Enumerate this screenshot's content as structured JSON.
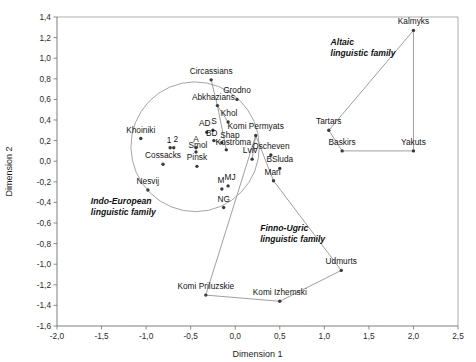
{
  "chart_data": {
    "type": "scatter",
    "title": "",
    "xlabel": "Dimension 1",
    "ylabel": "Dimension 2",
    "xlim": [
      -2.0,
      2.5
    ],
    "ylim": [
      -1.6,
      1.4
    ],
    "xticks": [
      "-2,0",
      "-1,5",
      "-1,0",
      "-0,5",
      "0,0",
      "0,5",
      "1,0",
      "1,5",
      "2,0",
      "2,5"
    ],
    "xtick_values": [
      -2.0,
      -1.5,
      -1.0,
      -0.5,
      0.0,
      0.5,
      1.0,
      1.5,
      2.0,
      2.5
    ],
    "yticks": [
      "1,4",
      "1,2",
      "1,0",
      "0,8",
      "0,6",
      "0,4",
      "0,2",
      "0,0",
      "-0,2",
      "-0,4",
      "-0,6",
      "-0,8",
      "-1,0",
      "-1,2",
      "-1,4",
      "-1,6"
    ],
    "ytick_values": [
      1.4,
      1.2,
      1.0,
      0.8,
      0.6,
      0.4,
      0.2,
      0.0,
      -0.2,
      -0.4,
      -0.6,
      -0.8,
      -1.0,
      -1.2,
      -1.4,
      -1.6
    ],
    "grid": false,
    "legend": "none",
    "decimal_separator": "comma",
    "point_color": "#3a3a3a",
    "line_color": "#8e8e8e",
    "points": [
      {
        "label": "Circassians",
        "x": -0.27,
        "y": 0.79,
        "label_dx": 0,
        "label_dy": -6
      },
      {
        "label": "Abkhazians",
        "x": -0.2,
        "y": 0.54,
        "label_dx": -4,
        "label_dy": -6
      },
      {
        "label": "Grodno",
        "x": 0.02,
        "y": 0.6,
        "label_dx": 0,
        "label_dy": -6
      },
      {
        "label": "Khol",
        "x": -0.08,
        "y": 0.38,
        "label_dx": 1,
        "label_dy": -6
      },
      {
        "label": "AD",
        "x": -0.32,
        "y": 0.28,
        "label_dx": -2,
        "label_dy": -6
      },
      {
        "label": "S",
        "x": -0.25,
        "y": 0.3,
        "label_dx": 1,
        "label_dy": -6
      },
      {
        "label": "BD",
        "x": -0.24,
        "y": 0.2,
        "label_dx": -2,
        "label_dy": -5
      },
      {
        "label": "Shap",
        "x": -0.15,
        "y": 0.18,
        "label_dx": 8,
        "label_dy": -5
      },
      {
        "label": "Kostroma",
        "x": -0.1,
        "y": 0.11,
        "label_dx": 7,
        "label_dy": -5
      },
      {
        "label": "Khoiniki",
        "x": -1.06,
        "y": 0.22,
        "label_dx": 0,
        "label_dy": -6
      },
      {
        "label": "1",
        "x": -0.73,
        "y": 0.13,
        "label_dx": -1,
        "label_dy": -5
      },
      {
        "label": "2",
        "x": -0.69,
        "y": 0.13,
        "label_dx": 2,
        "label_dy": -6
      },
      {
        "label": "A",
        "x": -0.44,
        "y": 0.13,
        "label_dx": 0,
        "label_dy": -6
      },
      {
        "label": "Smol",
        "x": -0.44,
        "y": 0.09,
        "label_dx": 2,
        "label_dy": -4
      },
      {
        "label": "Cossacks",
        "x": -0.81,
        "y": -0.03,
        "label_dx": 0,
        "label_dy": -6
      },
      {
        "label": "Pinsk",
        "x": -0.43,
        "y": -0.05,
        "label_dx": 0,
        "label_dy": -6
      },
      {
        "label": "Komi Permyats",
        "x": 0.23,
        "y": 0.25,
        "label_dx": 0,
        "label_dy": -6
      },
      {
        "label": "Lviv",
        "x": 0.19,
        "y": 0.02,
        "label_dx": -2,
        "label_dy": -6
      },
      {
        "label": "Oscheven",
        "x": 0.4,
        "y": 0.06,
        "label_dx": 0,
        "label_dy": -6
      },
      {
        "label": "BSluda",
        "x": 0.5,
        "y": -0.07,
        "label_dx": 0,
        "label_dy": -6
      },
      {
        "label": "Mari",
        "x": 0.43,
        "y": -0.19,
        "label_dx": -1,
        "label_dy": -6
      },
      {
        "label": "Nesvij",
        "x": -0.98,
        "y": -0.28,
        "label_dx": 0,
        "label_dy": -6
      },
      {
        "label": "M",
        "x": -0.15,
        "y": -0.27,
        "label_dx": -1,
        "label_dy": -6
      },
      {
        "label": "MJ",
        "x": -0.08,
        "y": -0.24,
        "label_dx": 2,
        "label_dy": -6
      },
      {
        "label": "NG",
        "x": -0.13,
        "y": -0.45,
        "label_dx": 0,
        "label_dy": -6
      },
      {
        "label": "Tartars",
        "x": 1.05,
        "y": 0.3,
        "label_dx": 0,
        "label_dy": -6
      },
      {
        "label": "Kalmyks",
        "x": 2.0,
        "y": 1.27,
        "label_dx": 0,
        "label_dy": -6
      },
      {
        "label": "Baskirs",
        "x": 1.2,
        "y": 0.1,
        "label_dx": 0,
        "label_dy": -6
      },
      {
        "label": "Yakuts",
        "x": 2.0,
        "y": 0.1,
        "label_dx": 0,
        "label_dy": -6
      },
      {
        "label": "Udmurts",
        "x": 1.19,
        "y": -1.06,
        "label_dx": 0,
        "label_dy": -6
      },
      {
        "label": "Komi Priluzskie",
        "x": -0.33,
        "y": -1.3,
        "label_dx": 0,
        "label_dy": -6
      },
      {
        "label": "Komi Izhemski",
        "x": 0.5,
        "y": -1.36,
        "label_dx": 0,
        "label_dy": -6
      }
    ],
    "groups": [
      {
        "name": "Altaic linguistic family",
        "label_lines": [
          "Altaic",
          "linguistic family"
        ],
        "label_x": 1.07,
        "label_y": 1.13,
        "shape": "polyline",
        "vertices": [
          {
            "x": 1.05,
            "y": 0.3
          },
          {
            "x": 2.0,
            "y": 1.27
          },
          {
            "x": 2.0,
            "y": 0.1
          },
          {
            "x": 1.2,
            "y": 0.1
          },
          {
            "x": 1.05,
            "y": 0.3
          }
        ]
      },
      {
        "name": "Finno-Ugric linguistic family",
        "label_lines": [
          "Finno-Ugric",
          "linguistic family"
        ],
        "label_x": 0.28,
        "label_y": -0.68,
        "shape": "polyline",
        "vertices": [
          {
            "x": 0.23,
            "y": 0.25
          },
          {
            "x": 0.43,
            "y": -0.19
          },
          {
            "x": 1.19,
            "y": -1.06
          },
          {
            "x": 0.5,
            "y": -1.36
          },
          {
            "x": -0.33,
            "y": -1.3
          },
          {
            "x": 0.23,
            "y": 0.25
          }
        ]
      },
      {
        "name": "Indo-European linguistic family",
        "label_lines": [
          "Indo-European",
          "linguistic family"
        ],
        "label_x": -1.62,
        "label_y": -0.42,
        "shape": "ellipse",
        "cx": -0.45,
        "cy": 0.14,
        "rx": 0.72,
        "ry": 0.63,
        "rotation": -12
      }
    ],
    "extra_lines": [
      {
        "name": "circassians-abkhazians-kostroma-link",
        "vertices": [
          {
            "x": -0.27,
            "y": 0.79
          },
          {
            "x": -0.2,
            "y": 0.54
          },
          {
            "x": -0.1,
            "y": 0.11
          }
        ]
      },
      {
        "name": "abkhazians-khol-link",
        "vertices": [
          {
            "x": -0.2,
            "y": 0.54
          },
          {
            "x": -0.08,
            "y": 0.38
          }
        ]
      },
      {
        "name": "bd-shap-link",
        "vertices": [
          {
            "x": -0.24,
            "y": 0.2
          },
          {
            "x": -0.15,
            "y": 0.18
          }
        ]
      },
      {
        "name": "komi-permyats-lviv-link",
        "vertices": [
          {
            "x": 0.23,
            "y": 0.25
          },
          {
            "x": 0.19,
            "y": 0.02
          }
        ]
      }
    ]
  }
}
